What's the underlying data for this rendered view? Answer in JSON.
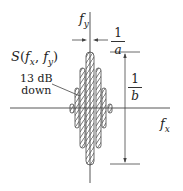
{
  "diagram": {
    "title_label": "S(f_x, f_y)",
    "title_parts": {
      "func": "S",
      "open": "(",
      "x": "f",
      "xsub": "x",
      "sep": ", ",
      "y": "f",
      "ysub": "y",
      "close": ")"
    },
    "axes": {
      "x_label": "f",
      "x_sub": "x",
      "y_label": "f",
      "y_sub": "y"
    },
    "annotations": {
      "sidelobe_label_line1": "13 dB",
      "sidelobe_label_line2": "down",
      "width_dimension": {
        "numerator": "1",
        "denominator": "a"
      },
      "height_dimension": {
        "numerator": "1",
        "denominator": "b"
      }
    },
    "lobes": [
      {
        "name": "main-lobe",
        "x": 86,
        "y": 52,
        "w": 8,
        "h": 113
      },
      {
        "name": "second-lobe-left",
        "x": 80,
        "y": 68,
        "w": 5,
        "h": 80
      },
      {
        "name": "second-lobe-right",
        "x": 96,
        "y": 68,
        "w": 5,
        "h": 80
      },
      {
        "name": "third-lobe-left",
        "x": 75,
        "y": 88,
        "w": 4,
        "h": 40
      },
      {
        "name": "third-lobe-right",
        "x": 102,
        "y": 88,
        "w": 4,
        "h": 40
      },
      {
        "name": "fourth-lobe-left",
        "x": 70,
        "y": 104,
        "w": 4,
        "h": 9
      },
      {
        "name": "fourth-lobe-right",
        "x": 108,
        "y": 104,
        "w": 4,
        "h": 9
      }
    ],
    "colors": {
      "ink": "#333333",
      "background": "#ffffff"
    }
  }
}
